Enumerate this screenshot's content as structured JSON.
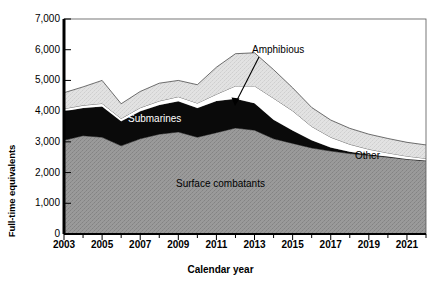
{
  "chart_data": {
    "type": "area",
    "stacked": true,
    "title": "",
    "xlabel": "Calendar year",
    "ylabel": "Full-time equivalents",
    "xlim": [
      2003,
      2022
    ],
    "ylim": [
      0,
      7000
    ],
    "ytick_labels": [
      "0",
      "1,000",
      "2,000",
      "3,000",
      "4,000",
      "5,000",
      "6,000",
      "7,000"
    ],
    "ytick_values": [
      0,
      1000,
      2000,
      3000,
      4000,
      5000,
      6000,
      7000
    ],
    "xtick_labels": [
      "2003",
      "2005",
      "2007",
      "2009",
      "2011",
      "2013",
      "2015",
      "2017",
      "2019",
      "2021"
    ],
    "xtick_values": [
      2003,
      2005,
      2007,
      2009,
      2011,
      2013,
      2015,
      2017,
      2019,
      2021
    ],
    "grid": false,
    "legend_position": "inline-annotations",
    "x": [
      2003,
      2004,
      2005,
      2006,
      2007,
      2008,
      2009,
      2010,
      2011,
      2012,
      2013,
      2014,
      2015,
      2016,
      2017,
      2018,
      2019,
      2020,
      2021,
      2022
    ],
    "series": [
      {
        "name": "Surface combatants",
        "color": "#999999",
        "values": [
          3050,
          3200,
          3150,
          2870,
          3100,
          3250,
          3320,
          3150,
          3300,
          3450,
          3380,
          3100,
          2950,
          2800,
          2700,
          2620,
          2560,
          2500,
          2430,
          2380
        ]
      },
      {
        "name": "Submarines",
        "color": "#000000",
        "values": [
          950,
          900,
          1000,
          800,
          900,
          950,
          1000,
          950,
          1030,
          950,
          880,
          620,
          420,
          250,
          120,
          60,
          30,
          20,
          15,
          10
        ]
      },
      {
        "name": "Amphibious",
        "color": "#ffffff",
        "values": [
          80,
          90,
          100,
          90,
          110,
          130,
          150,
          160,
          220,
          420,
          560,
          700,
          640,
          450,
          330,
          240,
          170,
          120,
          90,
          70
        ]
      },
      {
        "name": "Other",
        "color": "#e0e0e0",
        "values": [
          520,
          600,
          750,
          480,
          530,
          580,
          530,
          600,
          880,
          1050,
          1080,
          930,
          750,
          620,
          560,
          520,
          490,
          470,
          450,
          440
        ]
      }
    ],
    "annotations": [
      {
        "name": "Amphibious",
        "label": "Amphibious",
        "type": "arrow-label"
      },
      {
        "name": "Submarines",
        "label": "Submarines",
        "type": "inline-label"
      },
      {
        "name": "Surface combatants",
        "label": "Surface combatants",
        "type": "inline-label"
      },
      {
        "name": "Other",
        "label": "Other",
        "type": "inline-label"
      }
    ]
  },
  "axes": {
    "ylabel": "Full-time equivalents",
    "xlabel": "Calendar year"
  },
  "labels": {
    "amphibious": "Amphibious",
    "submarines": "Submarines",
    "surface_combatants": "Surface combatants",
    "other": "Other"
  }
}
